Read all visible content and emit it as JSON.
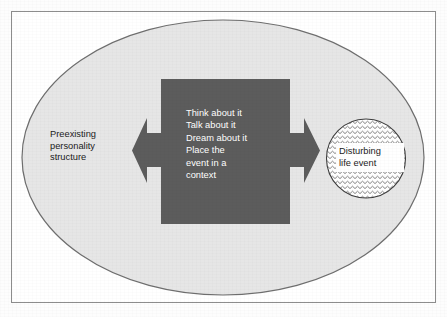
{
  "figure": {
    "type": "conceptual-diagram",
    "background_shape": "ellipse",
    "watermark_text": "  muis\nd"
  },
  "colors": {
    "border": "#8d8d8d",
    "ellipse_fill": "#e6e6e6",
    "ellipse_stroke": "#6e6e6e",
    "center_box_fill": "#5c5c5c",
    "arrow_fill": "#5c5c5c",
    "circle_stroke": "#3d3d3d",
    "pattern_stroke": "#6b6b6b",
    "text_dark": "#1b1b1b",
    "text_light": "#ffffff",
    "label_box_fill": "#ffffff"
  },
  "nodes": {
    "left": {
      "name": "preexisting-personality-structure",
      "label": "Preexisting\npersonality\nstructure",
      "shape": "none"
    },
    "center": {
      "name": "processing-activities",
      "label": "Think about it\nTalk about it\nDream about it\nPlace the\nevent in a\ncontext",
      "shape": "rectangle",
      "fill": "#5c5c5c"
    },
    "right": {
      "name": "disturbing-life-event",
      "label": "Disturbing\nlife event",
      "shape": "circle",
      "pattern": "zigzag-wave"
    }
  },
  "arrows": [
    {
      "name": "arrow-left",
      "direction": "left",
      "points_to": "preexisting-personality-structure"
    },
    {
      "name": "arrow-right",
      "direction": "right",
      "points_to": "disturbing-life-event"
    }
  ]
}
